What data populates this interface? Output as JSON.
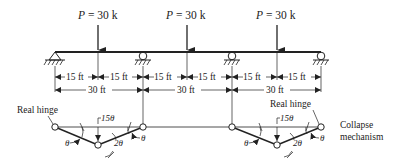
{
  "loads": [
    {
      "symbol": "P",
      "eq": " = 30 k",
      "x": 98
    },
    {
      "symbol": "P",
      "eq": " = 30 k",
      "x": 187
    },
    {
      "symbol": "P",
      "eq": " = 30 k",
      "x": 277
    }
  ],
  "beam": {
    "x_start": 55,
    "x_end": 321,
    "y": 52
  },
  "supports": [
    {
      "type": "pin",
      "x": 55
    },
    {
      "type": "roller",
      "x": 143
    },
    {
      "type": "roller",
      "x": 232
    },
    {
      "type": "roller",
      "x": 321
    }
  ],
  "dimensions": {
    "half_spans": [
      "15 ft",
      "15 ft",
      "15 ft",
      "15 ft",
      "15 ft",
      "15 ft"
    ],
    "spans": [
      "30 ft",
      "30 ft",
      "30 ft"
    ]
  },
  "mechanism": {
    "left_hinge_label": "Real hinge",
    "right_hinge_label": "Real hinge",
    "deflection_label_left": "15θ",
    "deflection_label_right": "15θ",
    "angle_theta": "θ",
    "angle_2theta": "2θ",
    "caption_line1": "Collapse",
    "caption_line2": "mechanism"
  }
}
